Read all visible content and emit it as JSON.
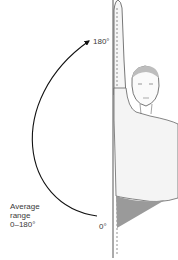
{
  "diagram": {
    "labels": {
      "max_angle": "180°",
      "min_angle": "0°",
      "range_line1": "Average",
      "range_line2": "range",
      "range_line3": "0–180°"
    },
    "figure": {
      "description": "Man standing with right arm raised straight overhead; vertical reference line; dashed arm outline",
      "shading_color": "#9a9a9a",
      "line_color": "#222222",
      "skin_fill": "#f4f4f4"
    },
    "arc": {
      "from_deg": 0,
      "to_deg": 180,
      "direction": "arrow at 180°",
      "color": "#111111"
    }
  }
}
